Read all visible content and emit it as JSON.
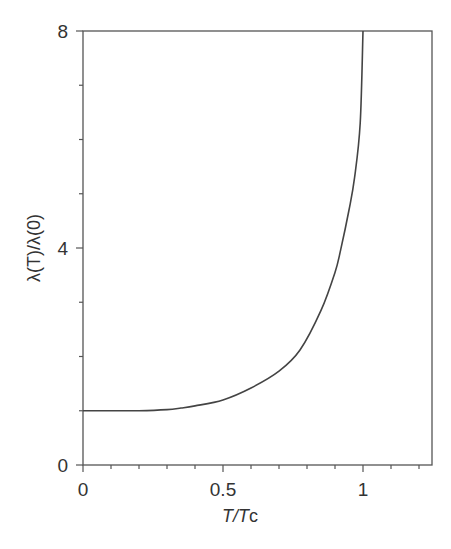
{
  "chart_data": {
    "type": "line",
    "title": "",
    "xlabel": "T/Tc",
    "ylabel": "λ(T)/λ(0)",
    "xlim": [
      0,
      1.25
    ],
    "ylim": [
      0,
      8
    ],
    "x_ticks": [
      0,
      0.1,
      0.2,
      0.3,
      0.4,
      0.5,
      0.6,
      0.7,
      0.8,
      0.9,
      1.0,
      1.1,
      1.2
    ],
    "x_tick_labels": [
      {
        "value": 0,
        "label": "0"
      },
      {
        "value": 0.5,
        "label": "0.5"
      },
      {
        "value": 1,
        "label": "1"
      }
    ],
    "y_ticks": [
      0,
      1,
      2,
      3,
      4,
      5,
      6,
      7,
      8
    ],
    "y_tick_labels": [
      {
        "value": 0,
        "label": "0"
      },
      {
        "value": 4,
        "label": "4"
      },
      {
        "value": 8,
        "label": "8"
      }
    ],
    "grid": false,
    "legend": null,
    "series": [
      {
        "name": "λ(T)/λ(0)",
        "color": "#444444",
        "x": [
          0,
          0.1,
          0.2,
          0.3,
          0.35,
          0.4,
          0.5,
          0.6,
          0.7,
          0.775,
          0.85,
          0.9,
          0.92,
          0.95,
          0.97,
          0.99,
          1.0
        ],
        "y": [
          1.0,
          1.0,
          1.0,
          1.02,
          1.05,
          1.09,
          1.2,
          1.42,
          1.73,
          2.12,
          2.85,
          3.55,
          3.96,
          4.7,
          5.3,
          6.3,
          8.0
        ]
      }
    ]
  },
  "labels": {
    "x_tick_0": "0",
    "x_tick_05": "0.5",
    "x_tick_1": "1",
    "y_tick_0": "0",
    "y_tick_4": "4",
    "y_tick_8": "8",
    "x_axis_T": "T",
    "x_axis_slash": "/",
    "x_axis_Tc_T": "T",
    "x_axis_Tc_c": "c",
    "y_axis_label": "λ(T)/λ(0)"
  }
}
